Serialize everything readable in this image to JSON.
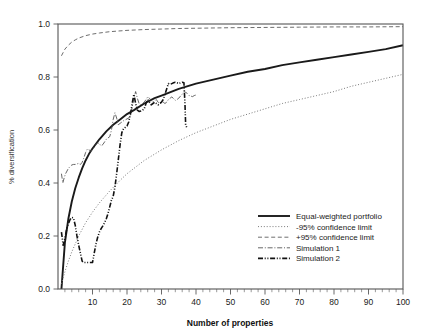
{
  "chart_data": {
    "type": "line",
    "title": "",
    "xlabel": "Number of properties",
    "ylabel": "% diversification",
    "xlim": [
      0,
      100
    ],
    "ylim": [
      0.0,
      1.0
    ],
    "xticks": [
      10,
      20,
      30,
      40,
      50,
      60,
      70,
      80,
      90,
      100
    ],
    "xtick_labels": [
      "10",
      "20",
      "30",
      "40",
      "50",
      "60",
      "70",
      "80",
      "90",
      "100"
    ],
    "xtick_minor_step": 2,
    "yticks": [
      0.0,
      0.2,
      0.4,
      0.6,
      0.8,
      1.0
    ],
    "ytick_labels": [
      "0.0",
      "0.2",
      "0.4",
      "0.6",
      "0.8",
      "1.0"
    ],
    "grid": false,
    "legend_position": "lower right",
    "series": [
      {
        "name": "Equal-weighted portfolio",
        "style": "solid",
        "color": "#1a1a1a",
        "width": 1.9,
        "x": [
          1,
          2,
          3,
          4,
          5,
          6,
          7,
          8,
          9,
          10,
          12,
          14,
          16,
          18,
          20,
          22,
          25,
          28,
          30,
          35,
          40,
          45,
          50,
          55,
          60,
          65,
          70,
          75,
          80,
          85,
          90,
          95,
          100
        ],
        "y": [
          0.0,
          0.175,
          0.265,
          0.33,
          0.38,
          0.42,
          0.455,
          0.485,
          0.51,
          0.53,
          0.565,
          0.595,
          0.62,
          0.64,
          0.66,
          0.675,
          0.7,
          0.72,
          0.73,
          0.755,
          0.775,
          0.79,
          0.805,
          0.82,
          0.83,
          0.845,
          0.855,
          0.865,
          0.875,
          0.885,
          0.895,
          0.905,
          0.92
        ]
      },
      {
        "name": "-95% confidence limit",
        "style": "dotted",
        "color": "#7a7a7a",
        "width": 1.0,
        "x": [
          1,
          2,
          3,
          4,
          5,
          6,
          8,
          10,
          12,
          15,
          18,
          20,
          25,
          30,
          35,
          40,
          45,
          50,
          55,
          60,
          65,
          70,
          75,
          80,
          85,
          90,
          95,
          100
        ],
        "y": [
          0.02,
          0.065,
          0.105,
          0.14,
          0.17,
          0.2,
          0.25,
          0.29,
          0.325,
          0.37,
          0.41,
          0.435,
          0.485,
          0.525,
          0.56,
          0.59,
          0.615,
          0.64,
          0.66,
          0.68,
          0.7,
          0.715,
          0.73,
          0.745,
          0.765,
          0.78,
          0.795,
          0.81
        ]
      },
      {
        "name": "+95% confidence limit",
        "style": "dashed",
        "color": "#6e6e6e",
        "width": 1.0,
        "x": [
          1,
          2,
          3,
          4,
          5,
          6,
          8,
          10,
          12,
          15,
          20,
          25,
          30,
          35,
          40,
          50,
          60,
          70,
          80,
          90,
          100
        ],
        "y": [
          0.88,
          0.905,
          0.92,
          0.932,
          0.94,
          0.947,
          0.956,
          0.962,
          0.966,
          0.971,
          0.976,
          0.979,
          0.981,
          0.983,
          0.984,
          0.986,
          0.987,
          0.988,
          0.989,
          0.989,
          0.99
        ]
      },
      {
        "name": "Simulation 1",
        "style": "dashdot-thin",
        "color": "#4a4a4a",
        "width": 0.85,
        "x": [
          1,
          1.4,
          1.8,
          2.2,
          2.6,
          3,
          3.5,
          4,
          4.5,
          5,
          5.5,
          6,
          6.5,
          7,
          7.5,
          8,
          8.5,
          9,
          9.5,
          10,
          10.5,
          11,
          11.5,
          12,
          12.5,
          13,
          13.5,
          14,
          14.5,
          15,
          15.5,
          16,
          16.5,
          17,
          17.5,
          18,
          18.5,
          19,
          19.5,
          20,
          20.5,
          21,
          21.5,
          22,
          22.5,
          23,
          23.5,
          24,
          24.5,
          25,
          25.5,
          26,
          26.5,
          27,
          27.5,
          28,
          28.5,
          29,
          29.5,
          30,
          30.5,
          31,
          31.5,
          32,
          32.5,
          33,
          33.5,
          34,
          34.5,
          35,
          35.5,
          36,
          36.5,
          37,
          37.5,
          38,
          38.5,
          39,
          39.5,
          40
        ],
        "y": [
          0.435,
          0.4,
          0.42,
          0.435,
          0.445,
          0.455,
          0.462,
          0.468,
          0.47,
          0.47,
          0.472,
          0.474,
          0.47,
          0.478,
          0.495,
          0.515,
          0.528,
          0.525,
          0.52,
          0.528,
          0.535,
          0.545,
          0.552,
          0.548,
          0.54,
          0.545,
          0.555,
          0.565,
          0.57,
          0.575,
          0.6,
          0.64,
          0.665,
          0.645,
          0.62,
          0.625,
          0.63,
          0.635,
          0.638,
          0.642,
          0.645,
          0.655,
          0.685,
          0.72,
          0.745,
          0.72,
          0.7,
          0.695,
          0.7,
          0.705,
          0.715,
          0.725,
          0.72,
          0.712,
          0.705,
          0.71,
          0.715,
          0.705,
          0.7,
          0.702,
          0.705,
          0.7,
          0.705,
          0.715,
          0.72,
          0.725,
          0.718,
          0.712,
          0.715,
          0.72,
          0.728,
          0.735,
          0.745,
          0.742,
          0.738,
          0.73,
          0.728,
          0.726,
          0.73,
          0.732
        ]
      },
      {
        "name": "Simulation 2",
        "style": "dashdotdot-thick",
        "color": "#111111",
        "width": 1.6,
        "x": [
          1,
          1.5,
          2,
          2.5,
          3,
          3.5,
          4,
          4.5,
          5,
          5.5,
          6,
          6.5,
          7,
          7.5,
          8,
          8.5,
          9,
          9.5,
          10,
          10.5,
          11,
          11.5,
          12,
          12.5,
          13,
          13.5,
          14,
          14.5,
          15,
          15.5,
          16,
          16.5,
          17,
          17.5,
          18,
          18.5,
          19,
          19.5,
          20,
          20.5,
          21,
          21.5,
          22,
          22.5,
          23,
          23.5,
          24,
          24.5,
          25,
          25.5,
          26,
          26.5,
          27,
          27.5,
          28,
          28.5,
          29,
          29.5,
          30,
          30.5,
          31,
          31.5,
          32,
          32.5,
          33,
          33.5,
          34,
          34.5,
          35,
          35.5,
          36,
          36.5,
          36.8,
          37,
          37.3,
          37.6
        ],
        "y": [
          0.215,
          0.165,
          0.19,
          0.225,
          0.245,
          0.262,
          0.27,
          0.268,
          0.24,
          0.2,
          0.165,
          0.135,
          0.105,
          0.1,
          0.1,
          0.1,
          0.1,
          0.1,
          0.1,
          0.135,
          0.17,
          0.195,
          0.215,
          0.228,
          0.238,
          0.25,
          0.265,
          0.285,
          0.31,
          0.335,
          0.35,
          0.385,
          0.435,
          0.49,
          0.545,
          0.59,
          0.605,
          0.61,
          0.615,
          0.63,
          0.66,
          0.7,
          0.735,
          0.7,
          0.675,
          0.67,
          0.672,
          0.675,
          0.68,
          0.7,
          0.715,
          0.705,
          0.695,
          0.7,
          0.705,
          0.7,
          0.695,
          0.7,
          0.705,
          0.715,
          0.735,
          0.755,
          0.775,
          0.772,
          0.775,
          0.778,
          0.78,
          0.778,
          0.775,
          0.778,
          0.78,
          0.778,
          0.7,
          0.62,
          0.61,
          0.612
        ]
      }
    ]
  },
  "legend": {
    "items": [
      {
        "label": "Equal-weighted portfolio",
        "style": "solid"
      },
      {
        "label": "-95% confidence limit",
        "style": "dotted"
      },
      {
        "label": "+95% confidence limit",
        "style": "dashed"
      },
      {
        "label": "Simulation 1",
        "style": "dashdot-thin"
      },
      {
        "label": "Simulation 2",
        "style": "dashdotdot-thick"
      }
    ]
  },
  "axes": {
    "x_title": "Number of properties",
    "y_title": "% diversification"
  }
}
